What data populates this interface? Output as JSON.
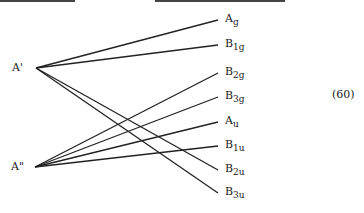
{
  "diagram": {
    "type": "correlation-diagram",
    "equation_number": "(60)",
    "left_nodes": [
      {
        "id": "A1",
        "base": "A",
        "prime": "'",
        "x": 36,
        "y": 68
      },
      {
        "id": "A2",
        "base": "A",
        "prime": "\"",
        "x": 35,
        "y": 167
      }
    ],
    "right_nodes": [
      {
        "id": "Ag",
        "base": "A",
        "sub": "g",
        "x": 218,
        "y": 20
      },
      {
        "id": "B1g",
        "base": "B",
        "sub": "1g",
        "x": 218,
        "y": 45
      },
      {
        "id": "B2g",
        "base": "B",
        "sub": "2g",
        "x": 218,
        "y": 73
      },
      {
        "id": "B3g",
        "base": "B",
        "sub": "3g",
        "x": 218,
        "y": 97
      },
      {
        "id": "Au",
        "base": "A",
        "sub": "u",
        "x": 218,
        "y": 122
      },
      {
        "id": "B1u",
        "base": "B",
        "sub": "1u",
        "x": 218,
        "y": 146
      },
      {
        "id": "B2u",
        "base": "B",
        "sub": "2u",
        "x": 218,
        "y": 170
      },
      {
        "id": "B3u",
        "base": "B",
        "sub": "3u",
        "x": 218,
        "y": 193
      }
    ],
    "edges": [
      {
        "from": "A1",
        "to": "Ag"
      },
      {
        "from": "A1",
        "to": "B1g"
      },
      {
        "from": "A1",
        "to": "B2u"
      },
      {
        "from": "A1",
        "to": "B3u"
      },
      {
        "from": "A2",
        "to": "B2g"
      },
      {
        "from": "A2",
        "to": "B3g"
      },
      {
        "from": "A2",
        "to": "Au"
      },
      {
        "from": "A2",
        "to": "B1u"
      }
    ],
    "line_color": "#222222"
  }
}
